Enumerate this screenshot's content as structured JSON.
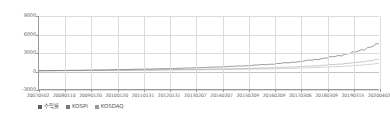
{
  "chart_data": {
    "type": "line",
    "title": "",
    "subtitle": "",
    "xlabel": "",
    "ylabel": "",
    "grid": true,
    "legend_position": "bottom-left",
    "ylim": [
      -3000,
      9000
    ],
    "yticks": [
      "9000",
      "6000",
      "3000",
      "0",
      "-3000"
    ],
    "ytick_values": [
      9000,
      6000,
      3000,
      0,
      -3000
    ],
    "xticks": [
      "20070502",
      "20080110",
      "20090120",
      "20100120",
      "20110131",
      "20120131",
      "20130207",
      "20140207",
      "20150209",
      "20160209",
      "20170306",
      "20180309",
      "20190315",
      "20200402"
    ],
    "x": [
      "20070502",
      "20080110",
      "20090120",
      "20100120",
      "20110131",
      "20120131",
      "20130207",
      "20140207",
      "20150209",
      "20160209",
      "20170306",
      "20180309",
      "20190315",
      "20200402"
    ],
    "series": [
      {
        "name": "수익률",
        "color": "#6f6f6f",
        "values": [
          0,
          60,
          110,
          180,
          260,
          360,
          480,
          640,
          840,
          1120,
          1520,
          2100,
          2950,
          4400
        ]
      },
      {
        "name": "KOSPI",
        "color": "#8a8a8a",
        "values": [
          0,
          30,
          55,
          90,
          130,
          175,
          230,
          300,
          390,
          510,
          680,
          930,
          1280,
          1850
        ]
      },
      {
        "name": "KOSDAQ",
        "color": "#a5a5a5",
        "values": [
          0,
          20,
          35,
          60,
          85,
          115,
          150,
          195,
          250,
          330,
          440,
          600,
          820,
          1180
        ]
      }
    ]
  },
  "legend": {
    "items": [
      {
        "label": "수익률",
        "color": "#5f5f5f"
      },
      {
        "label": "KOSPI",
        "color": "#7a7a7a"
      },
      {
        "label": "KOSDAQ",
        "color": "#9a9a9a"
      }
    ]
  },
  "colors": {
    "axis": "#9a9a9a",
    "grid": "#dcdcdc",
    "zero_line": "#c4c4c4",
    "line_primary": "#6f6f6f",
    "background": "#ffffff",
    "text": "#666666"
  }
}
